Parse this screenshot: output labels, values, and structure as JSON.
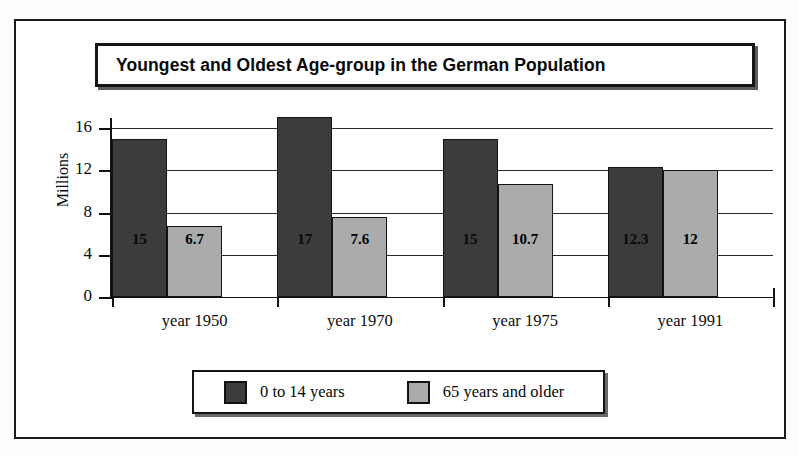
{
  "chart_data": {
    "type": "bar",
    "title": "Youngest and Oldest Age-group in the German Population",
    "xlabel": "",
    "ylabel": "Millions",
    "ylim": [
      0,
      18
    ],
    "yticks": [
      0,
      4,
      8,
      12,
      16
    ],
    "grid": true,
    "legend_position": "bottom",
    "categories": [
      "year 1950",
      "year 1970",
      "year 1975",
      "year 1991"
    ],
    "series": [
      {
        "name": "0 to 14 years",
        "color": "#3c3c3c",
        "values": [
          15,
          17,
          15,
          12.3
        ],
        "labels": [
          "15",
          "17",
          "15",
          "12.3"
        ]
      },
      {
        "name": "65 years and older",
        "color": "#ababab",
        "values": [
          6.7,
          7.6,
          10.7,
          12
        ],
        "labels": [
          "6.7",
          "7.6",
          "10.7",
          "12"
        ]
      }
    ]
  },
  "axis": {
    "y_tick_labels": [
      "16",
      "12",
      "8",
      "4",
      "0"
    ],
    "y_title": "Millions"
  },
  "legend": {
    "entries": [
      {
        "label": "0 to 14 years",
        "color": "#3c3c3c"
      },
      {
        "label": "65 years and older",
        "color": "#ababab"
      }
    ]
  }
}
